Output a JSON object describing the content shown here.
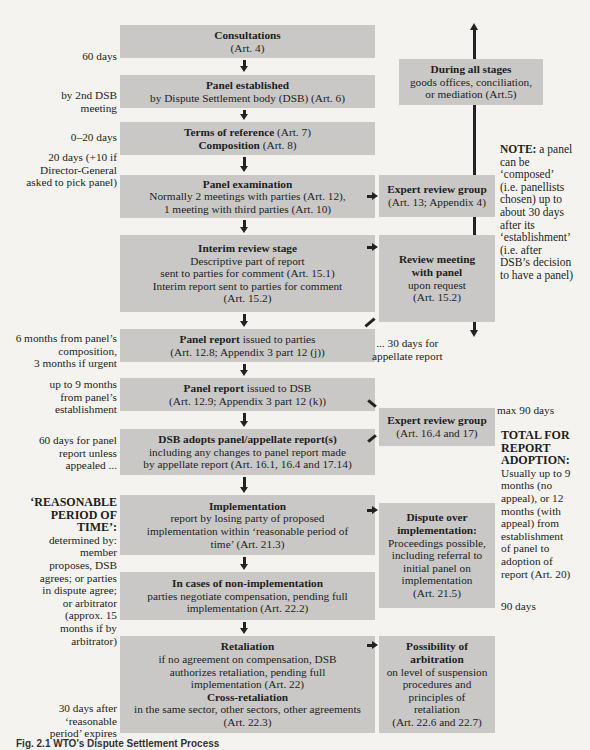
{
  "main_flow": [
    {
      "title": "Consultations",
      "detail": "(Art. 4)"
    },
    {
      "title": "Panel established",
      "detail": "by Dispute Settlement body (DSB) (Art. 6)"
    },
    {
      "title": "Terms of reference",
      "title_suffix": "(Art. 7)",
      "title2": "Composition",
      "title2_suffix": "(Art. 8)"
    },
    {
      "title": "Panel examination",
      "detail": "Normally 2 meetings with parties (Art. 12),",
      "detail2": "1 meeting with third parties (Art. 10)"
    },
    {
      "title": "Interim review stage",
      "detail": "Descriptive part of report",
      "detail2": "sent to parties for comment (Art. 15.1)",
      "detail3": "Interim report sent to parties for comment",
      "detail4": "(Art. 15.2)"
    },
    {
      "title": "Panel report",
      "title_suffix": "issued to parties",
      "detail": "(Art. 12.8; Appendix 3 part 12 (j))"
    },
    {
      "title": "Panel report",
      "title_suffix": "issued to DSB",
      "detail": "(Art. 12.9; Appendix 3 part 12 (k))"
    },
    {
      "title": "DSB adopts panel/appellate report(s)",
      "detail": "including any changes to panel report made",
      "detail2": "by appellate report (Art. 16.1, 16.4 and 17.14)"
    },
    {
      "title": "Implementation",
      "detail": "report by losing party of proposed",
      "detail2": "implementation within ‘reasonable period of",
      "detail3": "time’ (Art. 21.3)"
    },
    {
      "title": "In cases of non-implementation",
      "detail": "parties negotiate compensation, pending full",
      "detail2": "implementation (Art. 22.2)"
    },
    {
      "title": "Retaliation",
      "detail": "if no agreement on compensation, DSB",
      "detail2": "authorizes retaliation, pending full",
      "detail3": "implementation (Art. 22)",
      "title2": "Cross-retaliation",
      "detail4": "in the same sector, other sectors, other agreements",
      "detail5": "(Art. 22.3)"
    }
  ],
  "side_boxes": {
    "all_stages": {
      "title": "During all stages",
      "detail": "goods offices, conciliation,",
      "detail2": "or mediation (Art.5)"
    },
    "expert1": {
      "title": "Expert review group",
      "detail": "(Art. 13; Appendix 4)"
    },
    "review_meeting": {
      "title": "Review meeting",
      "title2": "with panel",
      "detail": "upon request",
      "detail2": "(Art. 15.2)"
    },
    "expert2": {
      "title": "Expert review group",
      "detail": "(Art. 16.4 and 17)"
    },
    "dispute_impl": {
      "title": "Dispute over",
      "title2": "implementation:",
      "detail": "Proceedings possible,",
      "detail2": "including referral to",
      "detail3": "initial panel on",
      "detail4": "implementation",
      "detail5": "(Art. 21.5)"
    },
    "arbitration": {
      "title": "Possibility of",
      "title2": "arbitration",
      "detail": "on level of suspension",
      "detail2": "procedures and",
      "detail3": "principles of",
      "detail4": "retaliation",
      "detail5": "(Art. 22.6 and 22.7)"
    }
  },
  "left_labels": {
    "l1": "60 days",
    "l2a": "by 2nd DSB",
    "l2b": "meeting",
    "l3": "0–20 days",
    "l4a": "20 days (+10 if",
    "l4b": "Director-General",
    "l4c": "asked to pick panel)",
    "l5a": "6 months from panel’s",
    "l5b": "composition,",
    "l5c": "3 months if urgent",
    "l6a": "up to 9 months",
    "l6b": "from panel’s",
    "l6c": "establishment",
    "l7a": "60 days for panel",
    "l7b": "report unless",
    "l7c": "appealed ...",
    "l8a": "‘REASONABLE",
    "l8b": "PERIOD OF",
    "l8c": "TIME’:",
    "l8d": "determined by:",
    "l8e": "member",
    "l8f": "proposes, DSB",
    "l8g": "agrees; or parties",
    "l8h": "in dispute agree;",
    "l8i": "or arbitrator",
    "l8j": "(approx. 15",
    "l8k": "months if by",
    "l8l": "arbitrator)",
    "l9a": "30 days after",
    "l9b": "‘reasonable",
    "l9c": "period’ expires"
  },
  "right_notes": {
    "note_label": "NOTE:",
    "note_a": " a panel",
    "note_b": "can be",
    "note_c": "‘composed’",
    "note_d": "(i.e. panellists",
    "note_e": "chosen) up to",
    "note_f": "about 30 days",
    "note_g": "after its",
    "note_h": "‘establishment’",
    "note_i": "(i.e. after",
    "note_j": "DSB’s decision",
    "note_k": "to have a panel)",
    "appellate_a": "... 30 days for",
    "appellate_b": "appellate report",
    "max90": "max 90 days",
    "total_a": "TOTAL FOR",
    "total_b": "REPORT",
    "total_c": "ADOPTION:",
    "total_d": "Usually up to 9",
    "total_e": "months (no",
    "total_f": "appeal), or 12",
    "total_g": "months (with",
    "total_h": "appeal) from",
    "total_i": "establishment",
    "total_j": "of panel to",
    "total_k": "adoption of",
    "total_l": "report (Art. 20)",
    "days90": "90 days"
  },
  "caption": "Fig. 2.1   WTO's Dispute Settlement Process"
}
